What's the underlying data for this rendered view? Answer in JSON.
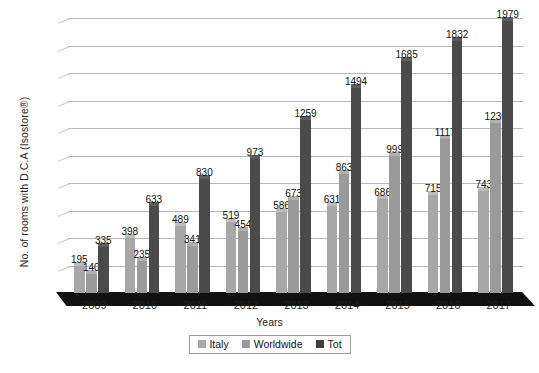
{
  "chart_data": {
    "type": "bar",
    "title": "",
    "xlabel": "Years",
    "ylabel": "No. of rooms with D.C.A (Isostore®)",
    "categories": [
      "2009",
      "2010",
      "2011",
      "2012",
      "2013",
      "2014",
      "2015",
      "2016",
      "2017"
    ],
    "series": [
      {
        "name": "Italy",
        "color": "#a7a7a7",
        "values": [
          195,
          398,
          489,
          519,
          586,
          631,
          686,
          715,
          743
        ]
      },
      {
        "name": "Worldwide",
        "color": "#9a9a9a",
        "values": [
          140,
          235,
          341,
          454,
          673,
          863,
          999,
          1117,
          1236
        ]
      },
      {
        "name": "Tot",
        "color": "#3f3f3f",
        "values": [
          335,
          633,
          830,
          973,
          1259,
          1494,
          1685,
          1832,
          1979
        ]
      }
    ],
    "ylim": [
      0,
      2000
    ],
    "ytick_step": 200,
    "yticks": [
      0,
      200,
      400,
      600,
      800,
      1000,
      1200,
      1400,
      1600,
      1800,
      2000
    ],
    "ytick_labels": [
      "0",
      "200",
      "400",
      "600",
      "800",
      "1000",
      "1200",
      "1400",
      "1600",
      "1800",
      "2000"
    ],
    "grid": true,
    "grid_axis": "y",
    "legend_position": "bottom",
    "data_labels": true,
    "style": "3d-clustered-column",
    "background": "#ffffff",
    "gridline_color": "#b9b9b9",
    "floor_color": "#111111"
  },
  "legend": {
    "items": [
      {
        "label": "Italy",
        "swatch": "italy"
      },
      {
        "label": "Worldwide",
        "swatch": "worldwide"
      },
      {
        "label": "Tot",
        "swatch": "tot"
      }
    ]
  },
  "caption": {
    "text": ""
  }
}
